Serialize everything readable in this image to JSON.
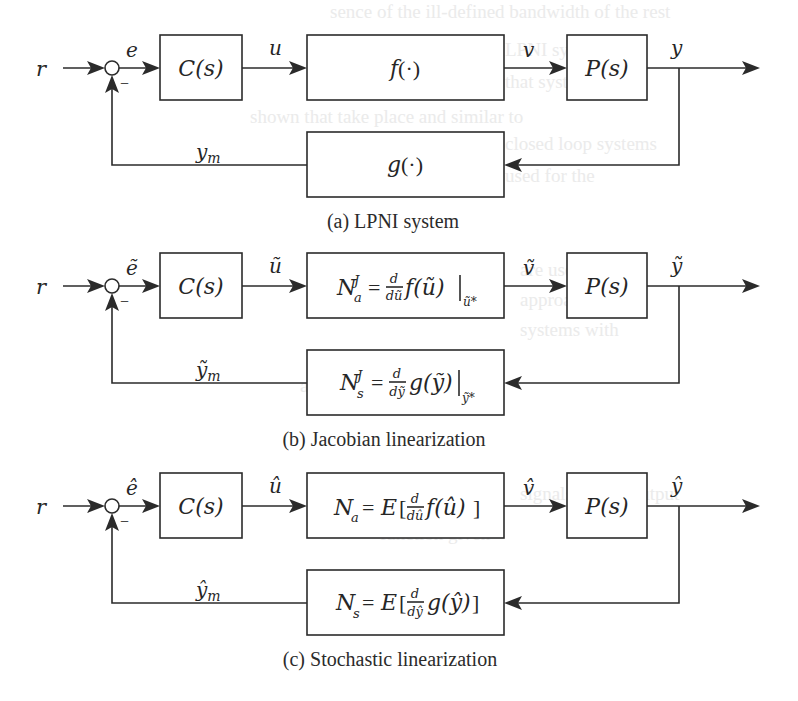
{
  "figure": {
    "panels": [
      {
        "id": "a",
        "caption": "(a) LPNI system",
        "input": "r",
        "error_signal": "e",
        "minus_sign": "−",
        "controller": "C(s)",
        "control_signal": "u",
        "actuator": {
          "main": "f",
          "rest": "(·)"
        },
        "actuator_output": "v",
        "plant": "P(s)",
        "output": "y",
        "sensor": {
          "main": "g",
          "rest": "(·)"
        },
        "measured_output": {
          "main": "y",
          "sub": "m"
        }
      },
      {
        "id": "b",
        "caption": "(b) Jacobian linearization",
        "input": "r",
        "error_signal": "ẽ",
        "minus_sign": "−",
        "controller": "C(s)",
        "control_signal": "ũ",
        "actuator": {
          "N": "N",
          "sub": "a",
          "sup": "J",
          "eq": "=",
          "d_num": "d",
          "d_den": "dũ",
          "func": "f(ũ)",
          "eval_at": "ũ*"
        },
        "actuator_output": "ṽ",
        "plant": "P(s)",
        "output": "ỹ",
        "sensor": {
          "N": "N",
          "sub": "s",
          "sup": "J",
          "eq": "=",
          "d_num": "d",
          "d_den": "dỹ",
          "func": "g(ỹ)",
          "eval_at": "ỹ*"
        },
        "measured_output": {
          "main": "ỹ",
          "sub": "m"
        }
      },
      {
        "id": "c",
        "caption": "(c) Stochastic linearization",
        "input": "r",
        "error_signal": "ê",
        "minus_sign": "−",
        "controller": "C(s)",
        "control_signal": "û",
        "actuator": {
          "N": "N",
          "sub": "a",
          "eq": "=",
          "E": "E",
          "open": "[",
          "d_num": "d",
          "d_den": "dû",
          "func": "f(û)",
          "close": "]"
        },
        "actuator_output": "v̂",
        "plant": "P(s)",
        "output": "ŷ",
        "sensor": {
          "N": "N",
          "sub": "s",
          "eq": "=",
          "E": "E",
          "open": "[",
          "d_num": "d",
          "d_den": "dŷ",
          "func": "g(ŷ)",
          "close": "]"
        },
        "measured_output": {
          "main": "ŷ",
          "sub": "m"
        }
      }
    ]
  },
  "colors": {
    "ink": "#2b2b2b",
    "background": "#ffffff"
  }
}
